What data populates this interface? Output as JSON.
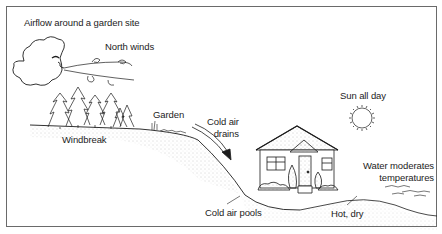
{
  "diagram": {
    "title": "Airflow around a garden site",
    "labels": {
      "north_winds": "North winds",
      "garden": "Garden",
      "windbreak": "Windbreak",
      "cold_air_drains_line1": "Cold air",
      "cold_air_drains_line2": "drains",
      "sun_all_day": "Sun all day",
      "water_line1": "Water moderates",
      "water_line2": "temperatures",
      "cold_air_pools": "Cold air pools",
      "hot_dry": "Hot, dry"
    },
    "elements": [
      "wind-cloud-face",
      "wind-swirls",
      "windbreak-trees",
      "garden-plants",
      "cold-air-arrow",
      "house",
      "sun",
      "water",
      "hillside-ground"
    ],
    "colors": {
      "line": "#1c1c1c",
      "border": "#6a6a6a",
      "stipple": "#9a9a9a",
      "background": "#ffffff"
    }
  }
}
